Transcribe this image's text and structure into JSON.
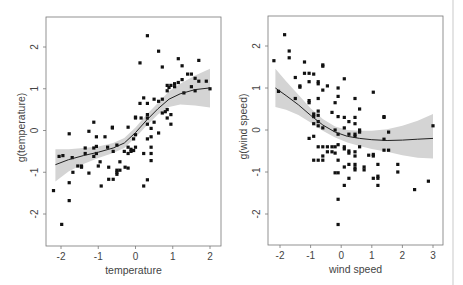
{
  "chart_data": [
    {
      "type": "scatter",
      "title": "",
      "xlabel": "temperature",
      "ylabel": "g(temperature)",
      "xlim": [
        -2.3,
        2.1
      ],
      "ylim": [
        -2.75,
        2.75
      ],
      "xticks": [
        -2,
        -1,
        0,
        1,
        2
      ],
      "yticks": [
        -2,
        -1,
        0,
        1,
        2
      ],
      "grid": false,
      "smooth": {
        "x": [
          -2.15,
          -1.8,
          -1.4,
          -1.0,
          -0.6,
          -0.3,
          0.0,
          0.3,
          0.6,
          0.9,
          1.2,
          1.6,
          2.0
        ],
        "y": [
          -0.82,
          -0.7,
          -0.6,
          -0.52,
          -0.42,
          -0.3,
          -0.05,
          0.25,
          0.52,
          0.75,
          0.88,
          0.98,
          1.02
        ],
        "lower": [
          -1.22,
          -0.98,
          -0.8,
          -0.66,
          -0.54,
          -0.42,
          -0.17,
          0.12,
          0.38,
          0.56,
          0.62,
          0.6,
          0.55
        ],
        "upper": [
          -0.45,
          -0.45,
          -0.42,
          -0.38,
          -0.3,
          -0.18,
          0.07,
          0.38,
          0.66,
          0.94,
          1.12,
          1.32,
          1.48
        ]
      },
      "points": [
        [
          -2.2,
          -1.44
        ],
        [
          -2.05,
          -0.62
        ],
        [
          -1.95,
          -0.6
        ],
        [
          -1.98,
          -2.25
        ],
        [
          -1.78,
          -0.08
        ],
        [
          -1.78,
          -1.25
        ],
        [
          -1.78,
          -1.68
        ],
        [
          -1.7,
          -0.65
        ],
        [
          -1.68,
          -1.0
        ],
        [
          -1.55,
          -0.85
        ],
        [
          -1.45,
          -0.85
        ],
        [
          -1.45,
          -0.88
        ],
        [
          -1.35,
          -0.42
        ],
        [
          -1.35,
          -0.55
        ],
        [
          -1.25,
          -0.02
        ],
        [
          -1.25,
          -1.02
        ],
        [
          -1.12,
          0.2
        ],
        [
          -1.12,
          -0.42
        ],
        [
          -1.12,
          -0.62
        ],
        [
          -1.05,
          -0.15
        ],
        [
          -1.05,
          -0.38
        ],
        [
          -1.05,
          -0.55
        ],
        [
          -1.0,
          -0.85
        ],
        [
          -0.95,
          -0.75
        ],
        [
          -0.92,
          -1.33
        ],
        [
          -0.82,
          -0.15
        ],
        [
          -0.75,
          -0.4
        ],
        [
          -0.72,
          -0.88
        ],
        [
          -0.72,
          -1.17
        ],
        [
          -0.62,
          0.08
        ],
        [
          -0.62,
          0.06
        ],
        [
          -0.6,
          -0.5
        ],
        [
          -0.6,
          -1.17
        ],
        [
          -0.5,
          -0.35
        ],
        [
          -0.5,
          -0.95
        ],
        [
          -0.5,
          -1.05
        ],
        [
          -0.5,
          -1.0
        ],
        [
          -0.42,
          -0.75
        ],
        [
          -0.42,
          -0.95
        ],
        [
          -0.3,
          -0.5
        ],
        [
          -0.28,
          -0.88
        ],
        [
          -0.2,
          0.08
        ],
        [
          -0.2,
          -0.4
        ],
        [
          -0.2,
          -0.55
        ],
        [
          -0.2,
          -0.9
        ],
        [
          -0.12,
          -0.45
        ],
        [
          -0.05,
          -0.2
        ],
        [
          -0.05,
          -0.48
        ],
        [
          0.0,
          0.32
        ],
        [
          0.0,
          0.3
        ],
        [
          0.0,
          -0.1
        ],
        [
          0.0,
          -0.4
        ],
        [
          0.12,
          1.62
        ],
        [
          0.12,
          0.65
        ],
        [
          0.15,
          0.3
        ],
        [
          0.22,
          0.78
        ],
        [
          0.22,
          -0.55
        ],
        [
          0.22,
          -1.33
        ],
        [
          0.32,
          2.27
        ],
        [
          0.32,
          0.65
        ],
        [
          0.32,
          0.38
        ],
        [
          0.32,
          0.3
        ],
        [
          0.32,
          0.15
        ],
        [
          0.32,
          -0.2
        ],
        [
          0.32,
          -1.18
        ],
        [
          0.42,
          0.05
        ],
        [
          0.42,
          -0.15
        ],
        [
          0.42,
          -0.4
        ],
        [
          0.42,
          -0.55
        ],
        [
          0.42,
          -0.72
        ],
        [
          0.5,
          0.75
        ],
        [
          0.5,
          0.2
        ],
        [
          0.62,
          1.9
        ],
        [
          0.62,
          0.7
        ],
        [
          0.62,
          -0.06
        ],
        [
          0.72,
          1.52
        ],
        [
          0.72,
          0.75
        ],
        [
          0.72,
          0.42
        ],
        [
          0.8,
          0.45
        ],
        [
          0.85,
          0.5
        ],
        [
          0.85,
          1.08
        ],
        [
          0.85,
          0.95
        ],
        [
          0.9,
          1.03
        ],
        [
          0.95,
          1.08
        ],
        [
          0.95,
          0.38
        ],
        [
          0.95,
          0.15
        ],
        [
          1.05,
          1.12
        ],
        [
          1.05,
          1.05
        ],
        [
          1.15,
          1.72
        ],
        [
          1.15,
          1.15
        ],
        [
          1.25,
          1.55
        ],
        [
          1.25,
          1.22
        ],
        [
          1.3,
          0.9
        ],
        [
          1.4,
          1.35
        ],
        [
          1.5,
          1.35
        ],
        [
          1.5,
          1.05
        ],
        [
          1.6,
          1.25
        ],
        [
          1.6,
          0.95
        ],
        [
          1.7,
          1.68
        ],
        [
          1.7,
          1.18
        ],
        [
          1.9,
          1.18
        ],
        [
          2.0,
          1.0
        ],
        [
          0.85,
          0.3
        ],
        [
          -0.12,
          -0.5
        ]
      ]
    },
    {
      "type": "scatter",
      "title": "",
      "xlabel": "wind speed",
      "ylabel": "g(wind speed)",
      "xlim": [
        -2.4,
        3.1
      ],
      "ylim": [
        -2.75,
        2.75
      ],
      "xticks": [
        -2,
        -1,
        0,
        1,
        2,
        3
      ],
      "yticks": [
        -2,
        -1,
        0,
        1,
        2
      ],
      "grid": false,
      "smooth": {
        "x": [
          -2.15,
          -1.8,
          -1.4,
          -1.0,
          -0.6,
          -0.2,
          0.2,
          0.6,
          1.0,
          1.5,
          2.0,
          2.5,
          3.0
        ],
        "y": [
          1.0,
          0.82,
          0.6,
          0.35,
          0.12,
          -0.05,
          -0.15,
          -0.2,
          -0.23,
          -0.25,
          -0.24,
          -0.22,
          -0.2
        ],
        "lower": [
          0.55,
          0.48,
          0.36,
          0.18,
          -0.02,
          -0.18,
          -0.3,
          -0.38,
          -0.45,
          -0.52,
          -0.6,
          -0.66,
          -0.68
        ],
        "upper": [
          1.46,
          1.16,
          0.84,
          0.52,
          0.26,
          0.08,
          0.0,
          -0.02,
          -0.02,
          0.02,
          0.1,
          0.22,
          0.38
        ]
      },
      "points": [
        [
          -2.2,
          1.65
        ],
        [
          -2.05,
          0.92
        ],
        [
          -1.85,
          2.27
        ],
        [
          -1.7,
          1.88
        ],
        [
          -1.7,
          1.72
        ],
        [
          -1.5,
          1.25
        ],
        [
          -1.5,
          0.75
        ],
        [
          -1.35,
          1.05
        ],
        [
          -1.35,
          1.02
        ],
        [
          -1.2,
          1.62
        ],
        [
          -1.2,
          1.35
        ],
        [
          -1.05,
          1.35
        ],
        [
          -1.05,
          1.15
        ],
        [
          -1.05,
          0.7
        ],
        [
          -1.05,
          0.65
        ],
        [
          -1.05,
          -0.2
        ],
        [
          -0.9,
          1.33
        ],
        [
          -0.9,
          0.38
        ],
        [
          -0.9,
          0.32
        ],
        [
          -0.9,
          0.15
        ],
        [
          -0.9,
          -0.15
        ],
        [
          -0.9,
          -0.72
        ],
        [
          -0.75,
          1.15
        ],
        [
          -0.75,
          1.1
        ],
        [
          -0.75,
          0.75
        ],
        [
          -0.75,
          0.45
        ],
        [
          -0.75,
          0.35
        ],
        [
          -0.75,
          0.2
        ],
        [
          -0.75,
          0.1
        ],
        [
          -0.75,
          -0.4
        ],
        [
          -0.75,
          -0.72
        ],
        [
          -0.6,
          1.55
        ],
        [
          -0.6,
          1.52
        ],
        [
          -0.6,
          0.95
        ],
        [
          -0.6,
          0.05
        ],
        [
          -0.6,
          -0.4
        ],
        [
          -0.6,
          -0.62
        ],
        [
          -0.6,
          -0.72
        ],
        [
          -0.45,
          1.05
        ],
        [
          -0.45,
          -0.4
        ],
        [
          -0.45,
          -0.52
        ],
        [
          -0.3,
          0.42
        ],
        [
          -0.3,
          -0.4
        ],
        [
          -0.3,
          -0.52
        ],
        [
          -0.2,
          0.65
        ],
        [
          -0.2,
          0.0
        ],
        [
          -0.2,
          -0.4
        ],
        [
          -0.2,
          -0.55
        ],
        [
          -0.2,
          -1.02
        ],
        [
          -0.1,
          1.0
        ],
        [
          -0.1,
          0.8
        ],
        [
          -0.1,
          0.32
        ],
        [
          -0.1,
          -0.1
        ],
        [
          -0.1,
          -0.35
        ],
        [
          -0.1,
          -0.72
        ],
        [
          -0.1,
          -1.02
        ],
        [
          -0.1,
          -1.65
        ],
        [
          -0.1,
          -2.25
        ],
        [
          0.1,
          1.22
        ],
        [
          0.1,
          0.3
        ],
        [
          0.1,
          0.05
        ],
        [
          0.1,
          -0.4
        ],
        [
          0.1,
          -0.45
        ],
        [
          0.1,
          -0.88
        ],
        [
          0.1,
          -1.32
        ],
        [
          0.25,
          0.2
        ],
        [
          0.25,
          -0.1
        ],
        [
          0.25,
          -0.5
        ],
        [
          0.25,
          -0.55
        ],
        [
          0.25,
          -0.82
        ],
        [
          0.25,
          -1.15
        ],
        [
          0.45,
          0.75
        ],
        [
          0.45,
          0.3
        ],
        [
          0.45,
          0.15
        ],
        [
          0.45,
          -0.1
        ],
        [
          0.45,
          -0.15
        ],
        [
          0.45,
          -0.52
        ],
        [
          0.45,
          -0.62
        ],
        [
          0.45,
          -0.82
        ],
        [
          0.45,
          -0.9
        ],
        [
          0.45,
          -0.95
        ],
        [
          0.6,
          0.5
        ],
        [
          0.6,
          0.0
        ],
        [
          0.6,
          -0.05
        ],
        [
          0.6,
          -0.4
        ],
        [
          0.75,
          -0.88
        ],
        [
          0.75,
          -0.95
        ],
        [
          0.9,
          -0.6
        ],
        [
          1.05,
          0.9
        ],
        [
          1.05,
          -0.58
        ],
        [
          1.05,
          -0.62
        ],
        [
          1.05,
          -1.15
        ],
        [
          1.2,
          -0.82
        ],
        [
          1.2,
          -1.1
        ],
        [
          1.2,
          -1.15
        ],
        [
          1.2,
          -1.32
        ],
        [
          1.4,
          0.32
        ],
        [
          1.4,
          0.3
        ],
        [
          1.4,
          -0.22
        ],
        [
          1.4,
          -0.48
        ],
        [
          1.55,
          -0.05
        ],
        [
          1.55,
          -0.48
        ],
        [
          1.85,
          -0.82
        ],
        [
          1.85,
          -1.0
        ],
        [
          2.4,
          -1.42
        ],
        [
          2.85,
          -1.22
        ],
        [
          3.0,
          0.1
        ]
      ]
    }
  ]
}
